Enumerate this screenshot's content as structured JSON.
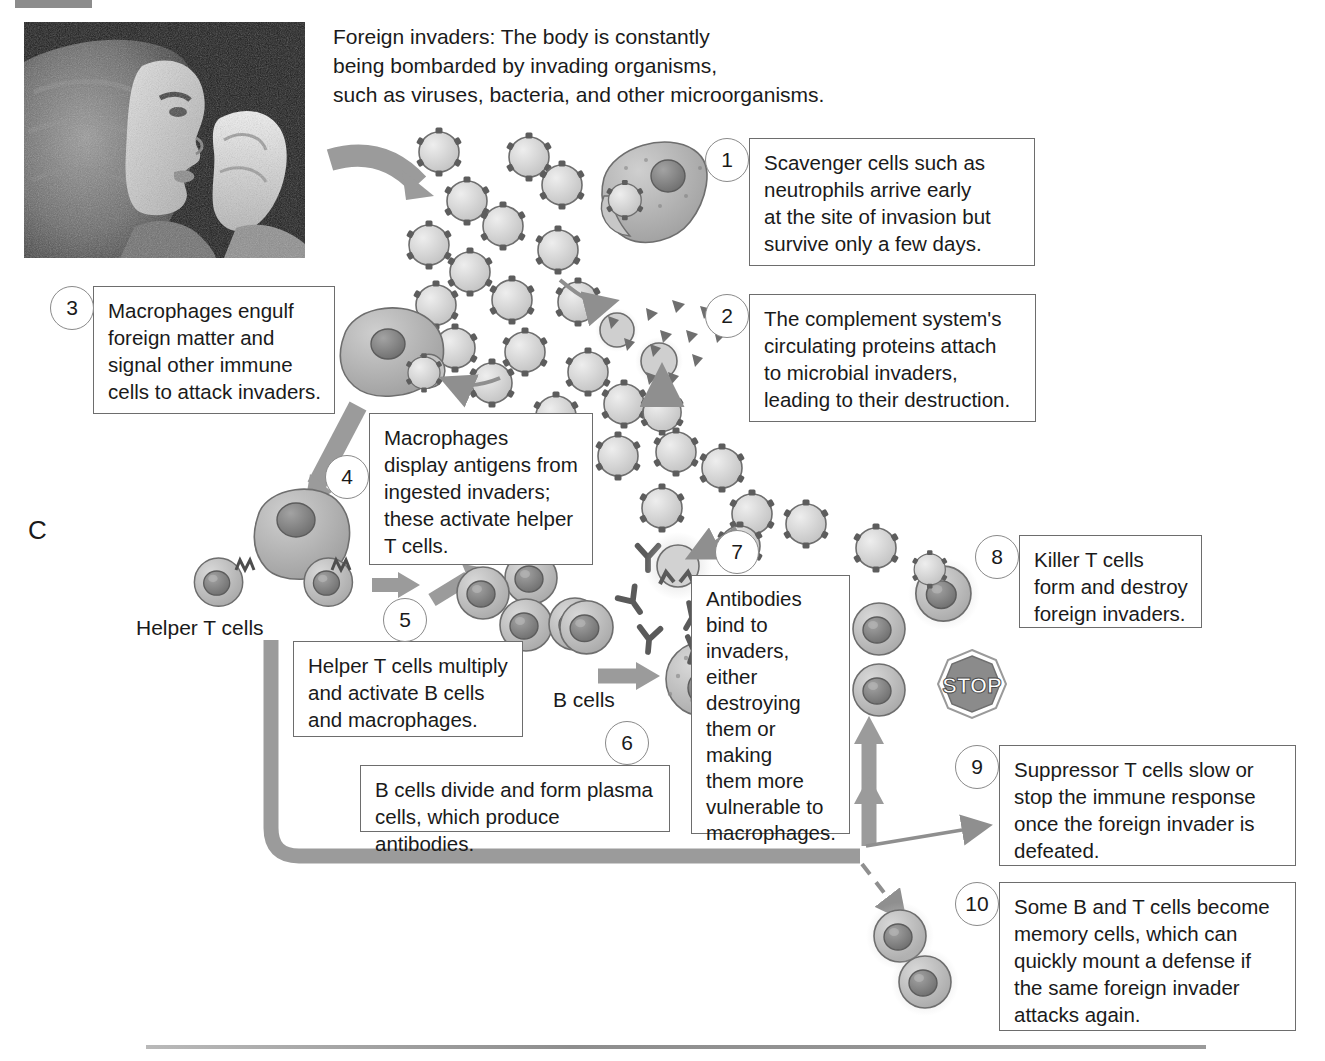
{
  "figure": {
    "letter": "C",
    "intro": "Foreign invaders: The body is constantly\nbeing bombarded by invading organisms,\nsuch as viruses, bacteria, and other microorganisms."
  },
  "photo": {
    "alt": "Person sneezing into a tissue"
  },
  "labels": {
    "helper_t_cells": "Helper T cells",
    "b_cells": "B cells",
    "stop_sign": "STOP"
  },
  "steps": [
    {
      "number": "1",
      "text": "Scavenger cells such as\nneutrophils arrive early\nat the site of invasion but\nsurvive only a few days."
    },
    {
      "number": "2",
      "text": "The complement system's\ncirculating proteins attach\nto microbial invaders,\nleading to their destruction."
    },
    {
      "number": "3",
      "text": "Macrophages engulf\nforeign matter and\nsignal other immune\ncells to attack invaders."
    },
    {
      "number": "4",
      "text": "Macrophages\ndisplay antigens from\ningested invaders;\nthese activate helper\nT cells."
    },
    {
      "number": "5",
      "text": "Helper T cells multiply\nand activate B cells\nand macrophages."
    },
    {
      "number": "6",
      "text": "B cells divide and form plasma\ncells, which produce antibodies."
    },
    {
      "number": "7",
      "text": "Antibodies\nbind to\ninvaders, either\ndestroying\nthem or\nmaking\nthem more\nvulnerable to\nmacrophages."
    },
    {
      "number": "8",
      "text": "Killer T cells\nform and destroy\nforeign invaders."
    },
    {
      "number": "9",
      "text": "Suppressor T cells slow or\nstop the immune response\nonce the foreign invader is\ndefeated."
    },
    {
      "number": "10",
      "text": "Some B and T cells become\nmemory cells, which can\nquickly mount a defense if\nthe same foreign invader\nattacks again."
    }
  ],
  "colors": {
    "box_border": "#6d6d6d",
    "text": "#1a1a1a",
    "arrow_gray": "#8f8f8f",
    "cell_fill": "#b4b4b4",
    "nucleus": "#7e7e7e",
    "virus_fill": "#d2d2d2",
    "rule": "#9a9a9a"
  }
}
